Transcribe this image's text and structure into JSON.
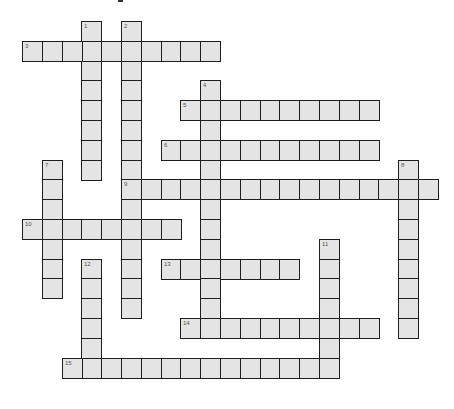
{
  "puzzle": {
    "type": "crossword",
    "grid": {
      "origin_x": 22,
      "origin_y": 21,
      "cell_size": 19.8,
      "cell_fill": "#e4e4e4",
      "border_color": "#1e1e1e"
    },
    "entries": [
      {
        "number": "1",
        "direction": "down",
        "col": 3,
        "row": 0,
        "length": 8
      },
      {
        "number": "2",
        "direction": "down",
        "col": 5,
        "row": 0,
        "length": 15
      },
      {
        "number": "3",
        "direction": "across",
        "col": 0,
        "row": 1,
        "length": 10
      },
      {
        "number": "4",
        "direction": "down",
        "col": 9,
        "row": 3,
        "length": 13
      },
      {
        "number": "5",
        "direction": "across",
        "col": 8,
        "row": 4,
        "length": 10
      },
      {
        "number": "6",
        "direction": "across",
        "col": 7,
        "row": 6,
        "length": 11
      },
      {
        "number": "7",
        "direction": "down",
        "col": 1,
        "row": 7,
        "length": 7
      },
      {
        "number": "8",
        "direction": "down",
        "col": 19,
        "row": 7,
        "length": 9
      },
      {
        "number": "9",
        "direction": "across",
        "col": 5,
        "row": 8,
        "length": 16
      },
      {
        "number": "10",
        "direction": "across",
        "col": 0,
        "row": 10,
        "length": 8
      },
      {
        "number": "11",
        "direction": "down",
        "col": 15,
        "row": 11,
        "length": 7
      },
      {
        "number": "12",
        "direction": "down",
        "col": 3,
        "row": 12,
        "length": 6
      },
      {
        "number": "13",
        "direction": "across",
        "col": 7,
        "row": 12,
        "length": 7
      },
      {
        "number": "14",
        "direction": "across",
        "col": 8,
        "row": 15,
        "length": 10
      },
      {
        "number": "15",
        "direction": "across",
        "col": 2,
        "row": 17,
        "length": 14
      }
    ]
  }
}
